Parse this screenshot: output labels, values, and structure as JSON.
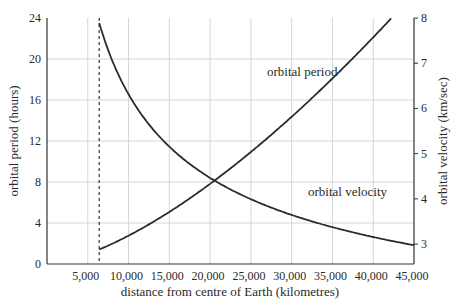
{
  "chart_data": {
    "type": "line",
    "title": "",
    "xlabel": "distance from centre of Earth (kilometres)",
    "ylabel": "orbital period (hours)",
    "y2label": "orbital velocity (km/sec)",
    "xlim": [
      0,
      45000
    ],
    "ylim": [
      0,
      24
    ],
    "y2lim": [
      2.56,
      8
    ],
    "grid": true,
    "legend": "inline labels",
    "x_ticks": [
      "5,000",
      "10,000",
      "15,000",
      "20,000",
      "25,000",
      "30,000",
      "35,000",
      "40,000",
      "45,000"
    ],
    "y_ticks": [
      "0",
      "4",
      "8",
      "12",
      "16",
      "20",
      "24"
    ],
    "y2_ticks": [
      "3",
      "4",
      "5",
      "6",
      "7",
      "8"
    ],
    "annotations": [
      {
        "type": "vertical-dashed-line",
        "x": 6400,
        "meaning": "Earth's surface"
      }
    ],
    "series": [
      {
        "name": "orbital period",
        "axis": "left",
        "label": "orbital period",
        "x": [
          6400,
          8000,
          10000,
          12000,
          15000,
          18000,
          20000,
          24000,
          27000,
          30000,
          33000,
          36000,
          39000,
          42000
        ],
        "values": [
          1.4,
          2.0,
          2.8,
          3.6,
          5.1,
          6.7,
          7.8,
          9.8,
          11.7,
          13.6,
          15.7,
          17.9,
          20.3,
          23.6
        ]
      },
      {
        "name": "orbital velocity",
        "axis": "right",
        "label": "orbital velocity",
        "x": [
          6400,
          8000,
          10000,
          12000,
          15000,
          18000,
          20000,
          24000,
          27000,
          30000,
          33000,
          36000,
          39000,
          42000,
          45000
        ],
        "values": [
          7.9,
          7.06,
          6.31,
          5.76,
          5.15,
          4.71,
          4.46,
          4.08,
          3.84,
          3.65,
          3.48,
          3.33,
          3.2,
          3.08,
          2.98
        ]
      }
    ]
  }
}
